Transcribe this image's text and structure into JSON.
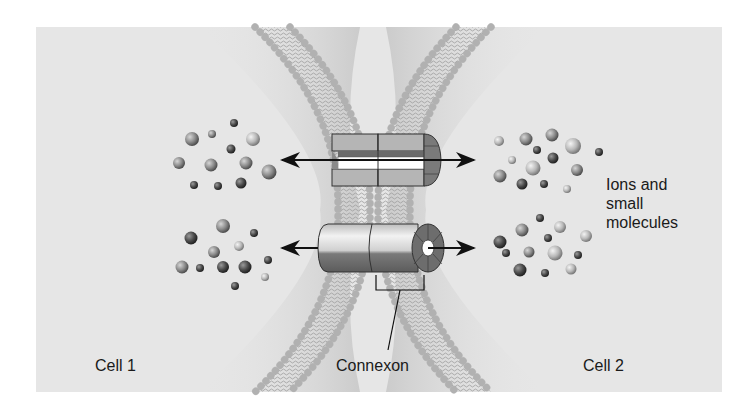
{
  "figure": {
    "labels": {
      "ions_line1": "Ions and",
      "ions_line2": "small",
      "ions_line3": "molecules",
      "cell1": "Cell 1",
      "cell2": "Cell 2",
      "connexon": "Connexon"
    },
    "colors": {
      "background": "#ffffff",
      "panel": "#e6e6e6",
      "membrane_head": "#c9c9c9",
      "membrane_tail": "#a8a8a8",
      "channel_light": "#d8d8d8",
      "channel_dark": "#6e6e6e",
      "arrow": "#111111",
      "text": "#1a1a1a"
    },
    "elements": {
      "membranes": [
        "cell-1-membrane",
        "cell-2-membrane"
      ],
      "channels": [
        "connexon-channel-cutaway",
        "connexon-channel-intact"
      ],
      "arrows": [
        "upper-bidirectional-arrow",
        "lower-bidirectional-arrow"
      ],
      "molecule_clusters": [
        "cell-1-upper",
        "cell-1-lower",
        "cell-2-upper",
        "cell-2-lower"
      ]
    }
  }
}
